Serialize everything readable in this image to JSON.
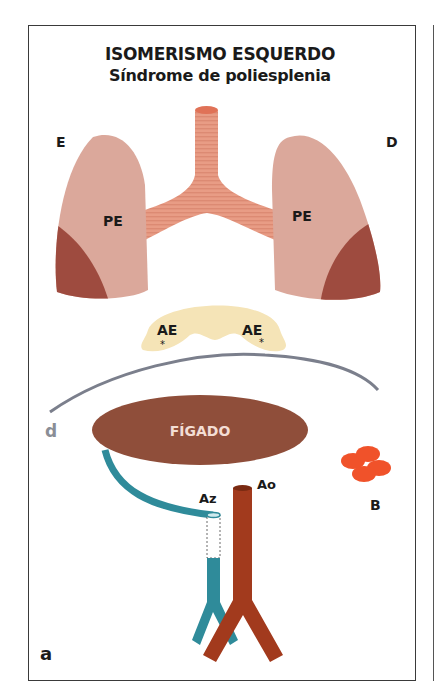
{
  "figure": {
    "title": "ISOMERISMO ESQUERDO",
    "subtitle": "Síndrome de poliesplenia",
    "panel_label": "a",
    "side_labels": {
      "left": "E",
      "right": "D"
    },
    "lungs": {
      "left_label": "PE",
      "right_label": "PE"
    },
    "atria": {
      "left_label": "AE",
      "right_label": "AE",
      "marker": "*"
    },
    "diaphragm_label": "d",
    "liver_label": "FÍGADO",
    "vessels": {
      "azygos_label": "Az",
      "aorta_label": "Ao"
    },
    "spleen_label": "B",
    "colors": {
      "lung_light": "#dba89b",
      "lung_dark": "#9e4b3f",
      "trachea": "#e89c85",
      "atria": "#f5e4b7",
      "diaphragm": "#7b7f8c",
      "liver": "#8f4e3a",
      "azygos": "#2f8b9a",
      "aorta": "#a23a1d",
      "spleen": "#f0522a"
    }
  }
}
